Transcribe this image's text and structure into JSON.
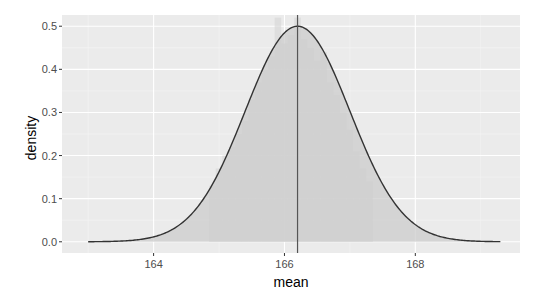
{
  "chart_data": {
    "type": "area",
    "title": "",
    "xlabel": "mean",
    "ylabel": "density",
    "xlim": [
      162.6,
      169.6
    ],
    "ylim": [
      -0.026,
      0.526
    ],
    "x_ticks": [
      164,
      166,
      168
    ],
    "x_tick_labels": [
      "164",
      "166",
      "168"
    ],
    "y_ticks": [
      0.0,
      0.1,
      0.2,
      0.3,
      0.4,
      0.5
    ],
    "y_tick_labels": [
      "0.0",
      "0.1",
      "0.2",
      "0.3",
      "0.4",
      "0.5"
    ],
    "grid": true,
    "legend": "none",
    "series": [
      {
        "name": "normal density curve",
        "kind": "line",
        "distribution": "normal",
        "mean": 166.2,
        "sd": 0.8,
        "x_range": [
          163.0,
          169.3
        ],
        "peak_density": 0.5
      },
      {
        "name": "histogram of sample means (density)",
        "kind": "histogram",
        "bin_width": 0.1,
        "bins": [
          {
            "x": 164.9,
            "y": 0.13
          },
          {
            "x": 165.0,
            "y": 0.17
          },
          {
            "x": 165.1,
            "y": 0.2
          },
          {
            "x": 165.2,
            "y": 0.22
          },
          {
            "x": 165.3,
            "y": 0.25
          },
          {
            "x": 165.4,
            "y": 0.28
          },
          {
            "x": 165.5,
            "y": 0.33
          },
          {
            "x": 165.6,
            "y": 0.37
          },
          {
            "x": 165.7,
            "y": 0.4
          },
          {
            "x": 165.8,
            "y": 0.43
          },
          {
            "x": 165.9,
            "y": 0.52
          },
          {
            "x": 166.0,
            "y": 0.46
          },
          {
            "x": 166.1,
            "y": 0.48
          },
          {
            "x": 166.2,
            "y": 0.52
          },
          {
            "x": 166.3,
            "y": 0.47
          },
          {
            "x": 166.4,
            "y": 0.45
          },
          {
            "x": 166.5,
            "y": 0.42
          },
          {
            "x": 166.6,
            "y": 0.44
          },
          {
            "x": 166.7,
            "y": 0.37
          },
          {
            "x": 166.8,
            "y": 0.34
          },
          {
            "x": 166.9,
            "y": 0.3
          },
          {
            "x": 167.0,
            "y": 0.26
          },
          {
            "x": 167.1,
            "y": 0.21
          },
          {
            "x": 167.2,
            "y": 0.17
          },
          {
            "x": 167.3,
            "y": 0.14
          }
        ]
      },
      {
        "name": "mean reference line",
        "kind": "vline",
        "x": 166.2
      }
    ]
  },
  "colors": {
    "panel_background": "#ebebeb",
    "grid_major": "#ffffff",
    "grid_minor": "#f5f5f5",
    "area_fill": "#cccccc",
    "histogram_fill": "#d9d9d9",
    "curve": "#333333",
    "vline": "#555555",
    "tick_text": "#4d4d4d"
  }
}
